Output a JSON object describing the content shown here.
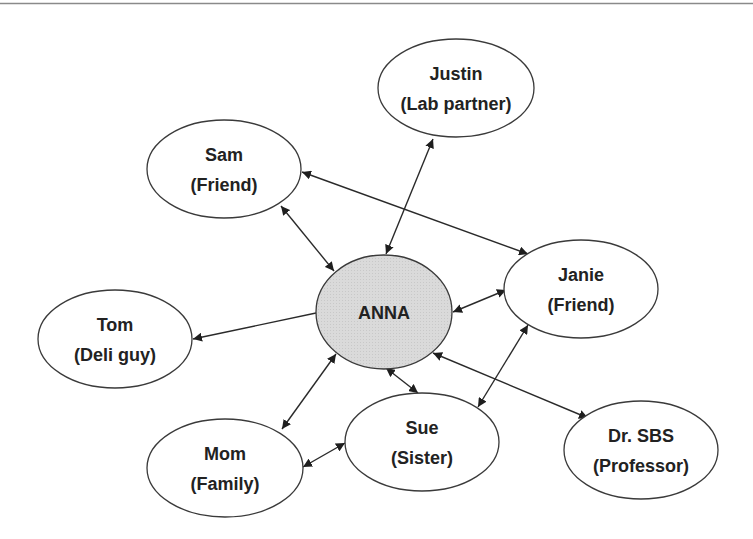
{
  "diagram": {
    "type": "social-network",
    "colors": {
      "top_rule": "#8a8a8a",
      "center_fill": "#d6d6d6",
      "node_fill": "#ffffff",
      "node_stroke": "#3a3a3a",
      "edge": "#2a2a2a",
      "text": "#222222"
    },
    "nodes": [
      {
        "id": "anna",
        "line1": "ANNA",
        "line2": "",
        "cx": 384,
        "cy": 312,
        "rx": 68,
        "ry": 57,
        "center": true
      },
      {
        "id": "justin",
        "line1": "Justin",
        "line2": "(Lab partner)",
        "cx": 456,
        "cy": 88,
        "rx": 78,
        "ry": 49
      },
      {
        "id": "sam",
        "line1": "Sam",
        "line2": "(Friend)",
        "cx": 224,
        "cy": 169,
        "rx": 77,
        "ry": 49
      },
      {
        "id": "janie",
        "line1": "Janie",
        "line2": "(Friend)",
        "cx": 581,
        "cy": 289,
        "rx": 77,
        "ry": 49
      },
      {
        "id": "tom",
        "line1": "Tom",
        "line2": "(Deli guy)",
        "cx": 115,
        "cy": 339,
        "rx": 77,
        "ry": 49
      },
      {
        "id": "mom",
        "line1": "Mom",
        "line2": "(Family)",
        "cx": 225,
        "cy": 468,
        "rx": 78,
        "ry": 49
      },
      {
        "id": "sue",
        "line1": "Sue",
        "line2": "(Sister)",
        "cx": 422,
        "cy": 442,
        "rx": 77,
        "ry": 49
      },
      {
        "id": "drsbs",
        "line1": "Dr. SBS",
        "line2": "(Professor)",
        "cx": 641,
        "cy": 450,
        "rx": 77,
        "ry": 49
      }
    ],
    "edges": [
      {
        "from": "anna",
        "to": "justin",
        "x1": 386,
        "y1": 254,
        "x2": 433,
        "y2": 139,
        "direction": "both"
      },
      {
        "from": "anna",
        "to": "sam",
        "x1": 334,
        "y1": 271,
        "x2": 281,
        "y2": 206,
        "direction": "both"
      },
      {
        "from": "sam",
        "to": "janie",
        "x1": 302,
        "y1": 172,
        "x2": 528,
        "y2": 254,
        "direction": "both"
      },
      {
        "from": "anna",
        "to": "janie",
        "x1": 453,
        "y1": 312,
        "x2": 506,
        "y2": 290,
        "direction": "both"
      },
      {
        "from": "anna",
        "to": "tom",
        "x1": 316,
        "y1": 313,
        "x2": 193,
        "y2": 339,
        "direction": "forward"
      },
      {
        "from": "anna",
        "to": "mom",
        "x1": 336,
        "y1": 354,
        "x2": 282,
        "y2": 429,
        "direction": "both"
      },
      {
        "from": "anna",
        "to": "sue",
        "x1": 386,
        "y1": 368,
        "x2": 418,
        "y2": 393,
        "direction": "both"
      },
      {
        "from": "mom",
        "to": "sue",
        "x1": 303,
        "y1": 467,
        "x2": 345,
        "y2": 443,
        "direction": "both"
      },
      {
        "from": "janie",
        "to": "sue",
        "x1": 528,
        "y1": 325,
        "x2": 478,
        "y2": 407,
        "direction": "both"
      },
      {
        "from": "anna",
        "to": "drsbs",
        "x1": 433,
        "y1": 353,
        "x2": 588,
        "y2": 418,
        "direction": "both"
      }
    ]
  }
}
